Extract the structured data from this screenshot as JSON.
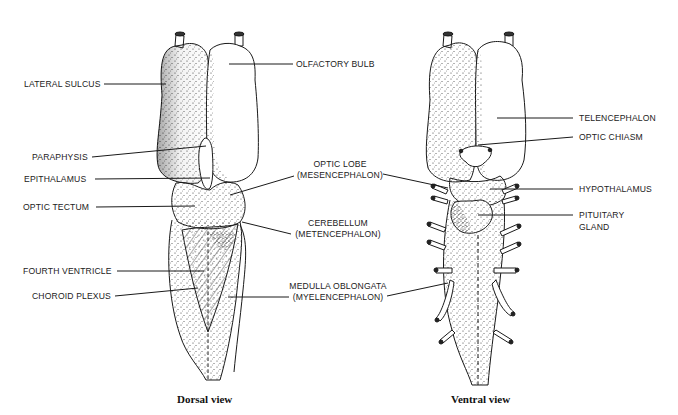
{
  "figure": {
    "clipped_caption_fragment": "",
    "views": [
      {
        "id": "dorsal",
        "caption": "Dorsal view"
      },
      {
        "id": "ventral",
        "caption": "Ventral view"
      }
    ]
  },
  "dorsal_labels": {
    "lateral_sulcus": "LATERAL SULCUS",
    "olfactory_bulb": "OLFACTORY BULB",
    "paraphysis": "PARAPHYSIS",
    "epithalamus": "EPITHALAMUS",
    "optic_tectum": "OPTIC TECTUM",
    "fourth_ventricle": "FOURTH VENTRICLE",
    "choroid_plexus": "CHOROID PLEXUS"
  },
  "center_labels": {
    "optic_lobe_1": "OPTIC LOBE",
    "optic_lobe_2": "(MESENCEPHALON)",
    "cerebellum_1": "CEREBELLUM",
    "cerebellum_2": "(METENCEPHALON)",
    "medulla_1": "MEDULLA OBLONGATA",
    "medulla_2": "(MYELENCEPHALON)"
  },
  "ventral_labels": {
    "telencephalon": "TELENCEPHALON",
    "optic_chiasm": "OPTIC CHIASM",
    "hypothalamus": "HYPOTHALAMUS",
    "pituitary_1": "PITUITARY",
    "pituitary_2": "GLAND"
  },
  "colors": {
    "ink": "#1a1a1a",
    "stipple": "#3a3a3a",
    "background": "#ffffff"
  }
}
